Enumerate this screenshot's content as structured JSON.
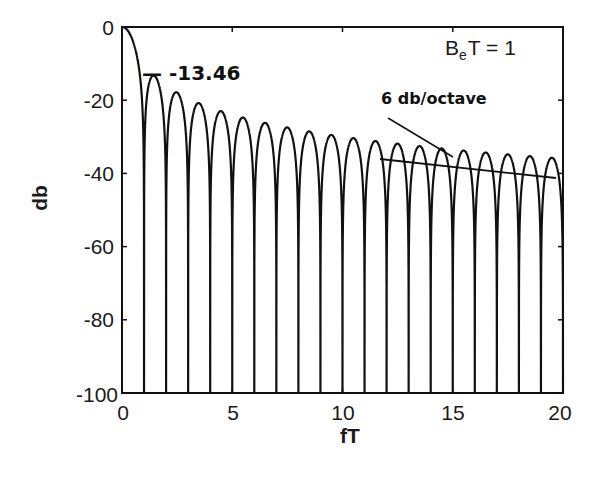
{
  "chart_data": {
    "type": "line",
    "title": "",
    "xlabel": "fT",
    "ylabel": "db",
    "xlim": [
      0,
      20
    ],
    "ylim": [
      -100,
      0
    ],
    "xticks": [
      0,
      5,
      10,
      15,
      20
    ],
    "yticks": [
      0,
      -20,
      -40,
      -60,
      -80,
      -100
    ],
    "xtick_labels": [
      "0",
      "5",
      "10",
      "15",
      "20"
    ],
    "ytick_labels": [
      "0",
      "-20",
      "-40",
      "-60",
      "-80",
      "-100"
    ],
    "grid": false,
    "legend": null,
    "series": [
      {
        "name": "sinc^2 spectrum, 10*log10((sin(pi fT)/(pi fT))^2)",
        "description": "Main lobe at 0 dB, nulls at integer fT going to -100 dB floor, sidelobe peaks decaying ~6 dB/octave",
        "sidelobe_peaks_x": [
          1.43,
          2.46,
          3.47,
          4.48,
          5.48,
          6.49,
          7.49,
          8.49,
          9.49,
          10.5,
          11.5,
          12.5,
          13.5,
          14.5,
          15.5,
          16.5,
          17.5,
          18.5,
          19.5
        ],
        "sidelobe_peaks_db": [
          -13.46,
          -17.9,
          -20.8,
          -23.0,
          -24.7,
          -26.2,
          -27.4,
          -28.5,
          -29.5,
          -30.4,
          -31.2,
          -32.0,
          -32.7,
          -33.3,
          -33.9,
          -34.5,
          -35.0,
          -35.5,
          -36.0
        ],
        "null_x": [
          1,
          2,
          3,
          4,
          5,
          6,
          7,
          8,
          9,
          10,
          11,
          12,
          13,
          14,
          15,
          16,
          17,
          18,
          19,
          20
        ],
        "null_db": -100
      }
    ],
    "annotations": [
      {
        "text": "-13.46",
        "x": 1.43,
        "y": -13.46,
        "note": "first sidelobe level"
      },
      {
        "text": "6 db/octave",
        "note": "slope line tangent to sidelobe peaks from fT≈11.5 to 19.7"
      },
      {
        "text": "BeT = 1",
        "note": "parameter label, upper right"
      }
    ]
  },
  "labels": {
    "xlabel": "fT",
    "ylabel": "db",
    "first_sidelobe": "— -13.46",
    "slope": "6 db/octave",
    "param_B": "B",
    "param_sub": "e",
    "param_rest": "T = 1",
    "xticks": [
      "0",
      "5",
      "10",
      "15",
      "20"
    ],
    "yticks": [
      "0",
      "-20",
      "-40",
      "-60",
      "-80",
      "-100"
    ]
  },
  "colors": {
    "ink": "#111111",
    "background": "#ffffff"
  }
}
